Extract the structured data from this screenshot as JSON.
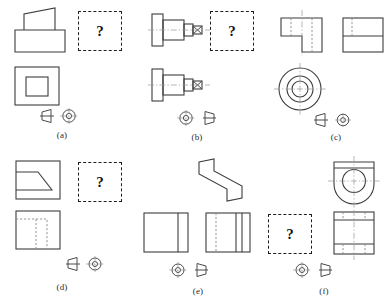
{
  "page": {
    "width": 383,
    "height": 305,
    "background": "#ffffff",
    "line_color": "#4a4a4a",
    "hidden_line_color": "#8a8a8a",
    "center_line_color": "#9a9a9a",
    "question_mark": "?",
    "question_box_border_color": "#1e1e1e"
  },
  "panels": [
    {
      "id": "a",
      "label": "(a)",
      "projection_symbol": "first-angle",
      "symbol_order": "cone-left-circles-right",
      "missing_view_position": "top-right",
      "views": [
        {
          "name": "front-view",
          "shape": "rectangle-with-slanted-wedge-on-top"
        },
        {
          "name": "top-view",
          "shape": "square-with-inner-square"
        }
      ]
    },
    {
      "id": "b",
      "label": "(b)",
      "projection_symbol": "third-angle",
      "symbol_order": "circles-left-cone-right",
      "missing_view_position": "top-right",
      "views": [
        {
          "name": "front-view",
          "shape": "stepped-shaft-with-flange-and-centerline"
        },
        {
          "name": "second-view",
          "shape": "stepped-shaft-with-flange-and-centerline"
        }
      ]
    },
    {
      "id": "c",
      "label": "(c)",
      "projection_symbol": "first-angle",
      "symbol_order": "cone-left-circles-right",
      "missing_view_position": "none",
      "views": [
        {
          "name": "front-view",
          "shape": "l-shaped-block-with-hidden-lines"
        },
        {
          "name": "side-view",
          "shape": "rectangle-with-horizontal-division-and-hidden-line"
        },
        {
          "name": "top-view",
          "shape": "concentric-circles-with-centerlines"
        }
      ]
    },
    {
      "id": "d",
      "label": "(d)",
      "projection_symbol": "first-angle",
      "symbol_order": "cone-left-circles-right",
      "missing_view_position": "top-right",
      "views": [
        {
          "name": "front-view",
          "shape": "square-with-chamfered-trapezoid"
        },
        {
          "name": "top-view",
          "shape": "square-with-hidden-u-channel"
        }
      ]
    },
    {
      "id": "e",
      "label": "(e)",
      "projection_symbol": "third-angle",
      "symbol_order": "circles-left-cone-right",
      "missing_view_position": "none",
      "views": [
        {
          "name": "pictorial-view",
          "shape": "z-shaped-offset-bracket"
        },
        {
          "name": "front-view",
          "shape": "square-with-right-vertical-band"
        },
        {
          "name": "side-view",
          "shape": "square-with-hidden-line-and-right-band"
        }
      ]
    },
    {
      "id": "f",
      "label": "(f)",
      "projection_symbol": "third-angle",
      "symbol_order": "circles-left-cone-right",
      "missing_view_position": "bottom-left",
      "views": [
        {
          "name": "front-view",
          "shape": "rounded-bearing-block-with-bore"
        },
        {
          "name": "top-view",
          "shape": "rectangle-with-horizontal-bands-and-hidden-lines"
        }
      ]
    }
  ]
}
